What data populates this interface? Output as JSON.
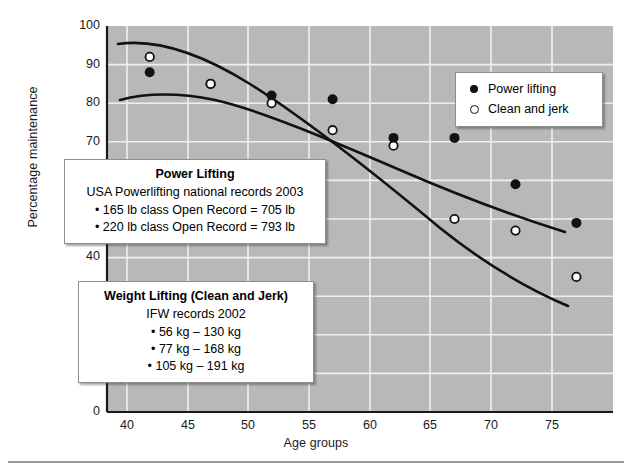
{
  "chart_data": {
    "type": "scatter",
    "title": "",
    "xlabel": "Age groups",
    "ylabel": "Percentage maintenance",
    "xlim": [
      36.5,
      78
    ],
    "ylim": [
      0,
      100
    ],
    "x_ticks": [
      40,
      45,
      50,
      55,
      60,
      65,
      70,
      75
    ],
    "y_ticks": [
      0,
      10,
      20,
      30,
      40,
      50,
      60,
      70,
      80,
      90,
      100
    ],
    "grid": true,
    "legend_position": "top-right",
    "x": [
      40,
      45,
      50,
      55,
      60,
      65,
      70,
      75
    ],
    "series": [
      {
        "name": "Power lifting",
        "marker": "filled-circle",
        "values": [
          88,
          85,
          82,
          81,
          71,
          71,
          59,
          49
        ]
      },
      {
        "name": "Clean and jerk",
        "marker": "open-circle",
        "values": [
          92,
          85,
          80,
          73,
          69,
          50,
          47,
          35
        ]
      }
    ]
  },
  "axes": {
    "y_title": "Percentage maintenance",
    "x_title": "Age groups",
    "x_tick_labels": [
      "40",
      "45",
      "50",
      "55",
      "60",
      "65",
      "70",
      "75"
    ],
    "y_tick_labels": [
      "100",
      "90",
      "80",
      "70",
      "60",
      "50",
      "40",
      "30",
      "20",
      "10",
      "0"
    ]
  },
  "legend": {
    "items": [
      {
        "label": "Power lifting",
        "marker": "filled-circle"
      },
      {
        "label": "Clean and jerk",
        "marker": "open-circle"
      }
    ]
  },
  "callouts": {
    "power": {
      "title": "Power Lifting",
      "subtitle": "USA Powerlifting national records 2003",
      "items": [
        "165 lb class Open Record = 705 lb",
        "220 lb class Open Record = 793 lb"
      ]
    },
    "weight": {
      "title": "Weight Lifting (Clean and Jerk)",
      "subtitle": "IFW records 2002",
      "items": [
        "56 kg – 130 kg",
        "77 kg – 168 kg",
        "105 kg – 191 kg"
      ]
    }
  },
  "colors": {
    "plot_background": "#b8b8b8",
    "grid": "#eeeeee",
    "axis": "#1a1a1a",
    "series_power": "#111111",
    "series_clean": "#111111"
  }
}
